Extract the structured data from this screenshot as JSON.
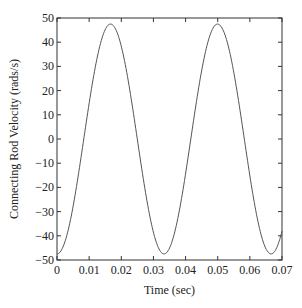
{
  "chart_data": {
    "type": "line",
    "title": "",
    "xlabel": "Time (sec)",
    "ylabel": "Connecting Rod Velocity (rads/s)",
    "xlim": [
      0,
      0.07
    ],
    "ylim": [
      -50,
      50
    ],
    "xticks": [
      0,
      0.01,
      0.02,
      0.03,
      0.04,
      0.05,
      0.06,
      0.07
    ],
    "xtick_labels": [
      "0",
      "0.01",
      "0.02",
      "0.03",
      "0.04",
      "0.05",
      "0.06",
      "0.07"
    ],
    "yticks": [
      -50,
      -40,
      -30,
      -20,
      -10,
      0,
      10,
      20,
      30,
      40,
      50
    ],
    "ytick_labels": [
      "-50",
      "-40",
      "-30",
      "-20",
      "-10",
      "0",
      "10",
      "20",
      "30",
      "40",
      "50"
    ],
    "grid": false,
    "legend": null,
    "line_color": "#555555",
    "series": [
      {
        "name": "Connecting Rod Velocity",
        "model": {
          "amplitude": 47.5,
          "period": 0.0333,
          "trough_time": 0.0,
          "form": "-A*cos(2*pi*(t - trough_time)/period)"
        },
        "x": [
          0,
          0.002,
          0.004,
          0.006,
          0.008,
          0.01,
          0.012,
          0.014,
          0.0167,
          0.019,
          0.021,
          0.023,
          0.025,
          0.027,
          0.029,
          0.031,
          0.0333,
          0.035,
          0.037,
          0.039,
          0.041,
          0.043,
          0.045,
          0.047,
          0.05,
          0.052,
          0.054,
          0.056,
          0.058,
          0.06,
          0.062,
          0.064,
          0.0666,
          0.068,
          0.07
        ],
        "y": [
          -47,
          -44,
          -34,
          -20,
          -5,
          12,
          27,
          40,
          47.5,
          44,
          36,
          23,
          8,
          -8,
          -23,
          -36,
          -47.5,
          -44,
          -36,
          -23,
          -7,
          9,
          24,
          37,
          47,
          44,
          36,
          23,
          8,
          -8,
          -24,
          -37,
          -47.5,
          -45,
          -40
        ]
      }
    ]
  }
}
